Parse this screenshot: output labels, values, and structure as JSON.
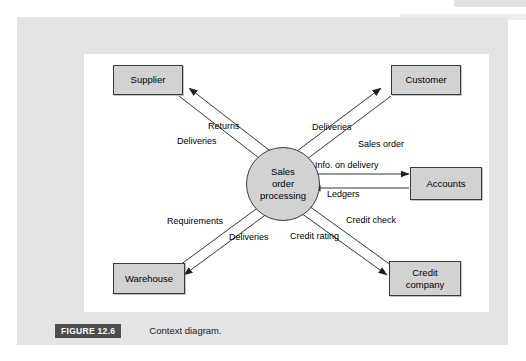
{
  "figure": {
    "tag": "FIGURE 12.6",
    "caption": "Context diagram."
  },
  "diagram": {
    "process": {
      "line1": "Sales",
      "line2": "order",
      "line3": "processing"
    },
    "entities": [
      {
        "id": "supplier",
        "label": "Supplier"
      },
      {
        "id": "customer",
        "label": "Customer"
      },
      {
        "id": "accounts",
        "label": "Accounts"
      },
      {
        "id": "warehouse",
        "label": "Warehouse"
      },
      {
        "id": "credit-company",
        "line1": "Credit",
        "line2": "company"
      }
    ],
    "flows": [
      {
        "id": "returns",
        "label": "Returns",
        "from": "process",
        "to": "supplier"
      },
      {
        "id": "deliveries-supplier",
        "label": "Deliveries",
        "from": "supplier",
        "to": "process"
      },
      {
        "id": "deliveries-customer",
        "label": "Deliveries",
        "from": "process",
        "to": "customer"
      },
      {
        "id": "sales-order",
        "label": "Sales order",
        "from": "customer",
        "to": "process"
      },
      {
        "id": "info-on-delivery",
        "label": "Info. on delivery",
        "from": "process",
        "to": "accounts"
      },
      {
        "id": "ledgers",
        "label": "Ledgers",
        "from": "accounts",
        "to": "process"
      },
      {
        "id": "requirements",
        "label": "Requirements",
        "from": "process",
        "to": "warehouse"
      },
      {
        "id": "deliveries-warehouse",
        "label": "Deliveries",
        "from": "warehouse",
        "to": "process"
      },
      {
        "id": "credit-check",
        "label": "Credit check",
        "from": "process",
        "to": "credit-company"
      },
      {
        "id": "credit-rating",
        "label": "Credit rating",
        "from": "credit-company",
        "to": "process"
      }
    ]
  },
  "colors": {
    "panel": "#e4e4e4",
    "canvas": "#ffffff",
    "shape_fill": "#d2d2d2",
    "shape_stroke": "#3a3a3a",
    "tag_bg": "#4d4d4d",
    "tag_text": "#ffffff"
  }
}
